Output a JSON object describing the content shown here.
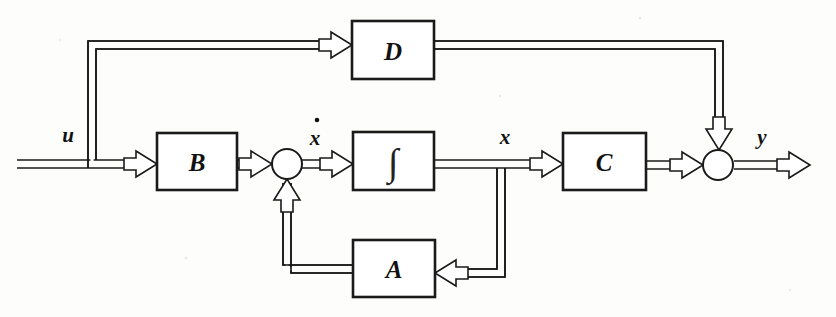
{
  "diagram": {
    "background_color": "#fdfdfb",
    "line_color": "#1a1a1a",
    "blocks": [
      {
        "id": "D",
        "label": "D",
        "x": 352,
        "y": 21,
        "w": 82,
        "h": 58,
        "role": "feedthrough-matrix"
      },
      {
        "id": "B",
        "label": "B",
        "x": 157,
        "y": 133,
        "w": 80,
        "h": 57,
        "role": "input-matrix"
      },
      {
        "id": "INT",
        "label": "∫",
        "x": 353,
        "y": 132,
        "w": 81,
        "h": 58,
        "role": "integrator"
      },
      {
        "id": "C",
        "label": "C",
        "x": 563,
        "y": 133,
        "w": 83,
        "h": 57,
        "role": "output-matrix"
      },
      {
        "id": "A",
        "label": "A",
        "x": 353,
        "y": 240,
        "w": 82,
        "h": 57,
        "role": "system-matrix"
      }
    ],
    "summing_junctions": [
      {
        "id": "sum-state",
        "cx": 287,
        "cy": 164,
        "r": 15,
        "inputs": [
          "B",
          "A"
        ],
        "output": "INT"
      },
      {
        "id": "sum-output",
        "cx": 718,
        "cy": 165,
        "r": 15,
        "inputs": [
          "C",
          "D"
        ],
        "output": "y"
      }
    ],
    "signals": [
      {
        "id": "u",
        "label": "u",
        "x": 68,
        "y": 135,
        "description": "input signal"
      },
      {
        "id": "xdot",
        "label": "x",
        "x": 315,
        "y": 136,
        "dot": true,
        "description": "state derivative"
      },
      {
        "id": "x",
        "label": "x",
        "x": 505,
        "y": 136,
        "description": "state vector"
      },
      {
        "id": "y",
        "label": "y",
        "x": 762,
        "y": 136,
        "description": "output signal"
      }
    ],
    "connections": [
      {
        "from": "u-input",
        "to": "B",
        "style": "double-line"
      },
      {
        "from": "u-branch",
        "to": "D",
        "style": "double-line"
      },
      {
        "from": "B",
        "to": "sum-state",
        "style": "double-line"
      },
      {
        "from": "sum-state",
        "to": "INT",
        "style": "double-line"
      },
      {
        "from": "INT",
        "to": "sum-output-via-C",
        "style": "double-line"
      },
      {
        "from": "x-branch",
        "to": "A",
        "style": "double-line"
      },
      {
        "from": "A",
        "to": "sum-state",
        "style": "double-line"
      },
      {
        "from": "C",
        "to": "sum-output",
        "style": "double-line"
      },
      {
        "from": "D",
        "to": "sum-output",
        "style": "double-line"
      },
      {
        "from": "sum-output",
        "to": "y-output",
        "style": "double-line"
      }
    ]
  }
}
